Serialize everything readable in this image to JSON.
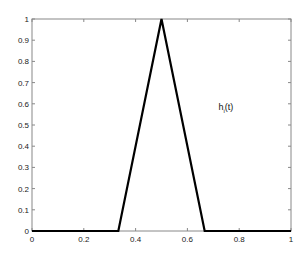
{
  "chart_data": {
    "type": "line",
    "title": "",
    "xlabel": "",
    "ylabel": "",
    "xlim": [
      0,
      1
    ],
    "ylim": [
      0,
      1
    ],
    "grid": false,
    "x_ticks": [
      "0",
      "0.2",
      "0.4",
      "0.6",
      "0.8",
      "1"
    ],
    "y_ticks": [
      "0",
      "0.1",
      "0.2",
      "0.3",
      "0.4",
      "0.5",
      "0.6",
      "0.7",
      "0.8",
      "0.9",
      "1"
    ],
    "series": [
      {
        "name": "h_i(t)",
        "x": [
          0,
          0.3333,
          0.5,
          0.6667,
          1
        ],
        "y": [
          0,
          0,
          1,
          0,
          0
        ],
        "color": "#000000"
      }
    ],
    "annotations": [
      {
        "text": "h",
        "subscript": "i",
        "suffix": "(t)",
        "x": 0.72,
        "y": 0.57
      }
    ]
  }
}
